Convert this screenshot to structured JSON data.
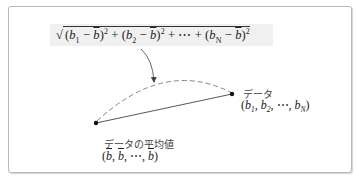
{
  "formula": {
    "sqrt_symbol": "√",
    "term1": {
      "open": "(",
      "var": "b",
      "sub": "1",
      "minus": " − ",
      "mean": "b",
      "close": ")",
      "sup": "2"
    },
    "plus1": " + ",
    "term2": {
      "open": "(",
      "var": "b",
      "sub": "2",
      "minus": " − ",
      "mean": "b",
      "close": ")",
      "sup": "2"
    },
    "plus2": " + ⋯ + ",
    "termN": {
      "open": "(",
      "var": "b",
      "sub": "N",
      "minus": " − ",
      "mean": "b",
      "close": ")",
      "sup": "2"
    },
    "description": "distance between data point and mean point"
  },
  "data_point": {
    "label": "データ",
    "coords_open": "(",
    "b1": "b",
    "b1_sub": "1",
    "sep1": ", ",
    "b2": "b",
    "b2_sub": "2",
    "sep2": ", ⋯, ",
    "bN": "b",
    "bN_sub": "N",
    "coords_close": ")"
  },
  "mean_point": {
    "label": "データの平均値",
    "coords_open": "(",
    "m1": "b",
    "sep1": ", ",
    "m2": "b",
    "sep2": ", ⋯, ",
    "m3": "b",
    "coords_close": ")"
  },
  "colors": {
    "frame_border": "#b9b9b9",
    "formula_background": "#f0f0f0",
    "line": "#444444",
    "dashed_arc": "#777777",
    "point": "#111111"
  }
}
